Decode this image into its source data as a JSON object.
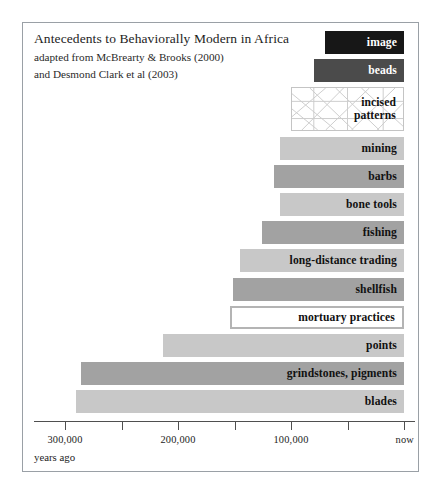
{
  "figure": {
    "title": "Antecedents to Behaviorally Modern in Africa",
    "subtitle_lines": [
      "adapted from McBrearty & Brooks (2000)",
      "and Desmond Clark et al (2003)"
    ],
    "axis_caption": "years ago"
  },
  "chart_data": {
    "type": "bar",
    "orientation": "horizontal",
    "title": "Antecedents to Behaviorally Modern in Africa",
    "subtitle": "adapted from McBrearty & Brooks (2000) and Desmond Clark et al (2003)",
    "xlabel": "years ago",
    "ylabel": "",
    "xlim": [
      320000,
      0
    ],
    "x_axis_direction": "reversed",
    "grid": false,
    "legend": "none",
    "x_tick_values": [
      300000,
      250000,
      200000,
      150000,
      100000,
      50000,
      0
    ],
    "x_tick_labels": [
      "300,000",
      "",
      "200,000",
      "",
      "100,000",
      "",
      "now"
    ],
    "categories": [
      "image",
      "beads",
      "incised patterns",
      "mining",
      "barbs",
      "bone tools",
      "fishing",
      "long-distance trading",
      "shellfish",
      "mortuary practices",
      "points",
      "grindstones, pigments",
      "blades"
    ],
    "values": [
      {
        "label": "image",
        "start_years_ago": 70000,
        "end_years_ago": 0,
        "style": "black",
        "fill": "#171717",
        "text_color": "#ffffff"
      },
      {
        "label": "beads",
        "start_years_ago": 80000,
        "end_years_ago": 0,
        "style": "dark",
        "fill": "#4b4b4b",
        "text_color": "#ffffff"
      },
      {
        "label": "incised\npatterns",
        "start_years_ago": 100000,
        "end_years_ago": 0,
        "style": "hatch",
        "fill": "#ffffff",
        "text_color": "#111111"
      },
      {
        "label": "mining",
        "start_years_ago": 110000,
        "end_years_ago": 0,
        "style": "light",
        "fill": "#c8c8c8",
        "text_color": "#111111"
      },
      {
        "label": "barbs",
        "start_years_ago": 115000,
        "end_years_ago": 0,
        "style": "medium",
        "fill": "#a2a2a2",
        "text_color": "#111111"
      },
      {
        "label": "bone tools",
        "start_years_ago": 110000,
        "end_years_ago": 0,
        "style": "light",
        "fill": "#c8c8c8",
        "text_color": "#111111"
      },
      {
        "label": "fishing",
        "start_years_ago": 126000,
        "end_years_ago": 0,
        "style": "medium",
        "fill": "#a2a2a2",
        "text_color": "#111111"
      },
      {
        "label": "long-distance trading",
        "start_years_ago": 145000,
        "end_years_ago": 0,
        "style": "light",
        "fill": "#c8c8c8",
        "text_color": "#111111"
      },
      {
        "label": "shellfish",
        "start_years_ago": 151000,
        "end_years_ago": 0,
        "style": "medium",
        "fill": "#a2a2a2",
        "text_color": "#111111"
      },
      {
        "label": "mortuary practices",
        "start_years_ago": 154000,
        "end_years_ago": 0,
        "style": "outline",
        "fill": "#ffffff",
        "text_color": "#111111"
      },
      {
        "label": "points",
        "start_years_ago": 213000,
        "end_years_ago": 0,
        "style": "light",
        "fill": "#c8c8c8",
        "text_color": "#111111"
      },
      {
        "label": "grindstones, pigments",
        "start_years_ago": 286000,
        "end_years_ago": 0,
        "style": "medium",
        "fill": "#a2a2a2",
        "text_color": "#111111"
      },
      {
        "label": "blades",
        "start_years_ago": 290000,
        "end_years_ago": 0,
        "style": "light",
        "fill": "#c8c8c8",
        "text_color": "#111111"
      }
    ]
  },
  "colors": {
    "light_gray": "#c8c8c8",
    "medium_gray": "#a2a2a2",
    "dark_gray": "#4b4b4b",
    "black": "#171717",
    "border": "#9aa0a6",
    "axis": "#4f4f4f"
  }
}
